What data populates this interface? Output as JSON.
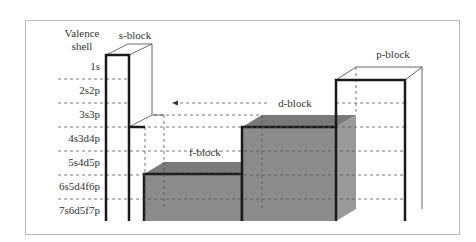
{
  "diagram": {
    "axis_title_line1": "Valence",
    "axis_title_line2": "shell",
    "shells": [
      "1s",
      "2s2p",
      "3s3p",
      "4s3d4p",
      "5s4d5p",
      "6s5d4f6p",
      "7s6d5f7p"
    ],
    "blocks": {
      "s": {
        "label": "s-block",
        "filled": false
      },
      "p": {
        "label": "p-block",
        "filled": false
      },
      "d": {
        "label": "d-block",
        "filled": true
      },
      "f": {
        "label": "f-block",
        "filled": true
      }
    },
    "colors": {
      "fill": "#8c8c8c",
      "fill_top": "#7a7a7a",
      "fill_side": "#9a9a9a",
      "edge": "#1a1a1a",
      "frame": "#bbbbbb",
      "dash": "#555555"
    }
  }
}
